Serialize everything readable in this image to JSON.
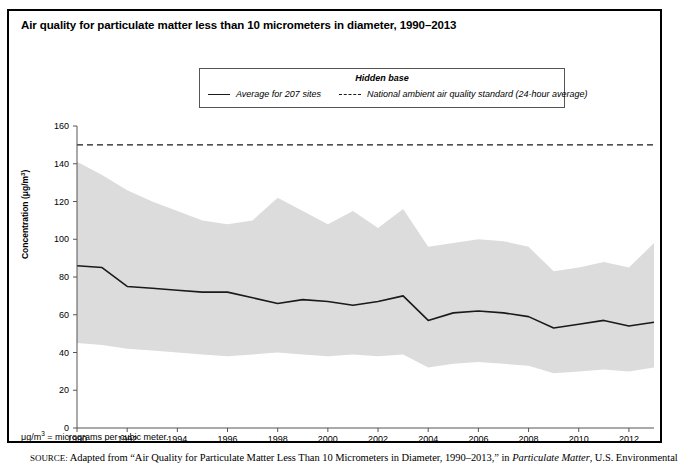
{
  "figure": {
    "title": "Air quality for particulate matter less than 10 micrometers in diameter, 1990–2013",
    "footnote_prefix": "μg/m",
    "footnote_sup": "3",
    "footnote_rest": " = micrograms per cubic meter.",
    "source_label": "SOURCE:",
    "source_text_1": " Adapted from “Air Quality for Particulate Matter Less Than 10 Micrometers in Diameter, 1990–2013,” in ",
    "source_italic": "Particulate Matter",
    "source_text_2": ", U.S. Environmental"
  },
  "legend": {
    "heading": "Hidden base",
    "items": [
      {
        "label": "Average for 207 sites",
        "style": "solid",
        "color": "#1a1a1a"
      },
      {
        "label": "National ambient air quality standard (24-hour average)",
        "style": "dashed",
        "color": "#1a1a1a"
      }
    ]
  },
  "colors": {
    "band_fill": "#dcdcdc",
    "line": "#1a1a1a",
    "standard_line": "#1a1a1a",
    "axis": "#555555",
    "frame": "#000000"
  },
  "chart_data": {
    "type": "area",
    "title": "Air quality for particulate matter less than 10 micrometers in diameter, 1990–2013",
    "xlabel": "",
    "ylabel": "Concentration (μg/m³)",
    "xlim": [
      1990,
      2013
    ],
    "ylim": [
      0,
      160
    ],
    "ytick_step": 20,
    "yticks": [
      0,
      20,
      40,
      60,
      80,
      100,
      120,
      140,
      160
    ],
    "xticks": [
      1990,
      1992,
      1994,
      1996,
      1998,
      2000,
      2002,
      2004,
      2006,
      2008,
      2010,
      2012
    ],
    "grid": false,
    "legend_position": "top-center",
    "x": [
      1990,
      1991,
      1992,
      1993,
      1994,
      1995,
      1996,
      1997,
      1998,
      1999,
      2000,
      2001,
      2002,
      2003,
      2004,
      2005,
      2006,
      2007,
      2008,
      2009,
      2010,
      2011,
      2012,
      2013
    ],
    "series": [
      {
        "name": "90th percentile (upper bound of shaded range)",
        "kind": "band_upper",
        "values": [
          141,
          134,
          126,
          120,
          115,
          110,
          108,
          110,
          122,
          115,
          108,
          115,
          106,
          116,
          96,
          98,
          100,
          99,
          96,
          83,
          85,
          88,
          85,
          98
        ]
      },
      {
        "name": "Average for 207 sites",
        "kind": "line",
        "values": [
          86,
          85,
          75,
          74,
          73,
          72,
          72,
          69,
          66,
          68,
          67,
          65,
          67,
          70,
          57,
          61,
          62,
          61,
          59,
          53,
          55,
          57,
          54,
          56
        ]
      },
      {
        "name": "10th percentile (lower bound of shaded range)",
        "kind": "band_lower",
        "values": [
          45,
          44,
          42,
          41,
          40,
          39,
          38,
          39,
          40,
          39,
          38,
          39,
          38,
          39,
          32,
          34,
          35,
          34,
          33,
          29,
          30,
          31,
          30,
          32
        ]
      },
      {
        "name": "National ambient air quality standard (24-hour average)",
        "kind": "constant_line",
        "value": 150
      }
    ]
  }
}
